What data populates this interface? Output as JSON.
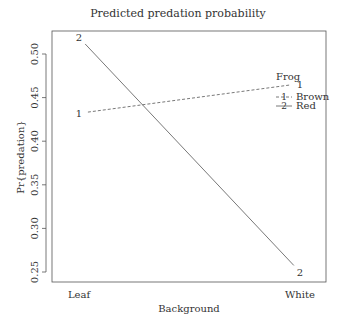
{
  "chart_data": {
    "type": "line",
    "title": "Predicted predation probability",
    "xlabel": "Background",
    "ylabel": "Pr{predation}",
    "categories": [
      "Leaf",
      "White"
    ],
    "ylim": [
      0.24,
      0.52
    ],
    "yticks": [
      0.25,
      0.3,
      0.35,
      0.4,
      0.45,
      0.5
    ],
    "ytick_labels": [
      "0.25",
      "0.30",
      "0.35",
      "0.40",
      "0.45",
      "0.50"
    ],
    "grid": false,
    "legend": {
      "title": "Frog",
      "placement": "top-right",
      "entries": [
        {
          "symbol": "1",
          "label": "Brown",
          "style": "dashed"
        },
        {
          "symbol": "2",
          "label": "Red",
          "style": "solid"
        }
      ]
    },
    "series": [
      {
        "name": "Brown",
        "symbol": "1",
        "style": "dashed",
        "values": [
          0.432,
          0.466
        ]
      },
      {
        "name": "Red",
        "symbol": "2",
        "style": "solid",
        "values": [
          0.519,
          0.25
        ]
      }
    ]
  }
}
